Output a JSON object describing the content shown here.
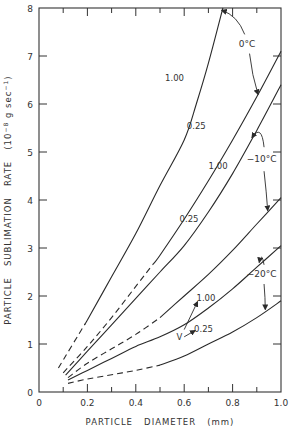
{
  "chart_data": {
    "type": "line",
    "title": "",
    "xlabel": "PARTICLE   DIAMETER   (mm)",
    "ylabel": "PARTICLE   SUBLIMATION   RATE   (10⁻⁸ g sec⁻¹)",
    "xlim": [
      0,
      1.0
    ],
    "ylim": [
      0,
      8
    ],
    "x_ticks": [
      0,
      0.2,
      0.4,
      0.6,
      0.8,
      1.0
    ],
    "x_tick_labels": [
      "0",
      "0.2",
      "0.4",
      "0.6",
      "0.8",
      "1.0"
    ],
    "x_minor_ticks": [
      0.1,
      0.3,
      0.5,
      0.7,
      0.9
    ],
    "y_ticks": [
      0,
      1,
      2,
      3,
      4,
      5,
      6,
      7,
      8
    ],
    "y_tick_labels": [
      "0",
      "1",
      "2",
      "3",
      "4",
      "5",
      "6",
      "7",
      "8"
    ],
    "grid": false,
    "legend": "none (inline annotations)",
    "series": [
      {
        "name": "0°C, V=1.00",
        "temperature": "0°C",
        "v": "1.00",
        "dashed_until": 0.19,
        "points": [
          [
            0.08,
            0.5
          ],
          [
            0.2,
            1.5
          ],
          [
            0.3,
            2.4
          ],
          [
            0.4,
            3.3
          ],
          [
            0.5,
            4.3
          ],
          [
            0.6,
            5.25
          ],
          [
            0.65,
            6.0
          ],
          [
            0.7,
            6.85
          ],
          [
            0.76,
            8.0
          ]
        ]
      },
      {
        "name": "0°C, V=0.25",
        "temperature": "0°C",
        "v": "0.25",
        "dashed_until": 0.47,
        "points": [
          [
            0.1,
            0.4
          ],
          [
            0.2,
            0.95
          ],
          [
            0.3,
            1.55
          ],
          [
            0.4,
            2.2
          ],
          [
            0.5,
            2.85
          ],
          [
            0.6,
            3.6
          ],
          [
            0.7,
            4.4
          ],
          [
            0.8,
            5.25
          ],
          [
            0.9,
            6.15
          ],
          [
            1.0,
            7.1
          ]
        ]
      },
      {
        "name": "-10°C, V=1.00",
        "temperature": "-10°C",
        "v": "1.00",
        "dashed_until": 0.11,
        "points": [
          [
            0.11,
            0.35
          ],
          [
            0.2,
            0.85
          ],
          [
            0.3,
            1.4
          ],
          [
            0.4,
            1.95
          ],
          [
            0.5,
            2.5
          ],
          [
            0.6,
            3.05
          ],
          [
            0.7,
            3.75
          ],
          [
            0.8,
            4.55
          ],
          [
            0.9,
            5.45
          ],
          [
            1.0,
            6.4
          ]
        ]
      },
      {
        "name": "-10°C, V=0.25",
        "temperature": "-10°C",
        "v": "0.25",
        "dashed_until": 0.5,
        "points": [
          [
            0.12,
            0.3
          ],
          [
            0.2,
            0.6
          ],
          [
            0.3,
            0.9
          ],
          [
            0.4,
            1.2
          ],
          [
            0.5,
            1.55
          ],
          [
            0.6,
            2.0
          ],
          [
            0.7,
            2.45
          ],
          [
            0.8,
            2.95
          ],
          [
            0.9,
            3.5
          ],
          [
            1.0,
            4.05
          ]
        ]
      },
      {
        "name": "-20°C, V=1.00",
        "temperature": "-20°C",
        "v": "1.00",
        "dashed_until": 0.12,
        "points": [
          [
            0.12,
            0.25
          ],
          [
            0.2,
            0.45
          ],
          [
            0.3,
            0.7
          ],
          [
            0.4,
            0.95
          ],
          [
            0.5,
            1.15
          ],
          [
            0.6,
            1.4
          ],
          [
            0.7,
            1.75
          ],
          [
            0.8,
            2.15
          ],
          [
            0.9,
            2.6
          ],
          [
            1.0,
            3.05
          ]
        ]
      },
      {
        "name": "-20°C, V=0.25",
        "temperature": "-20°C",
        "v": "0.25",
        "dashed_until": 0.5,
        "points": [
          [
            0.12,
            0.18
          ],
          [
            0.2,
            0.27
          ],
          [
            0.3,
            0.36
          ],
          [
            0.4,
            0.45
          ],
          [
            0.5,
            0.56
          ],
          [
            0.6,
            0.75
          ],
          [
            0.7,
            1.0
          ],
          [
            0.8,
            1.25
          ],
          [
            0.9,
            1.55
          ],
          [
            1.0,
            1.9
          ]
        ]
      }
    ],
    "annotations": [
      {
        "text": "0°C",
        "x": 0.86,
        "y": 7.25
      },
      {
        "text": "-10°C",
        "x": 0.92,
        "y": 4.85
      },
      {
        "text": "-20°C",
        "x": 0.92,
        "y": 2.45
      },
      {
        "text": "1.00",
        "x": 0.56,
        "y": 6.55,
        "series": "0°C, V=1.00"
      },
      {
        "text": "0.25",
        "x": 0.65,
        "y": 5.55,
        "series": "0°C, V=0.25"
      },
      {
        "text": "1.00",
        "x": 0.74,
        "y": 4.7,
        "series": "-10°C, V=1.00"
      },
      {
        "text": "0.25",
        "x": 0.62,
        "y": 3.6,
        "series": "-10°C, V=0.25"
      },
      {
        "text": "1.00",
        "x": 0.69,
        "y": 1.95,
        "series": "-20°C, V=1.00"
      },
      {
        "text": "0.25",
        "x": 0.68,
        "y": 1.32,
        "series": "-20°C, V=0.25"
      },
      {
        "text": "V",
        "x": 0.58,
        "y": 1.15
      }
    ]
  },
  "colors": {
    "line": "#2a2a2a",
    "axis": "#333333",
    "text": "#333333",
    "background": "#ffffff"
  }
}
